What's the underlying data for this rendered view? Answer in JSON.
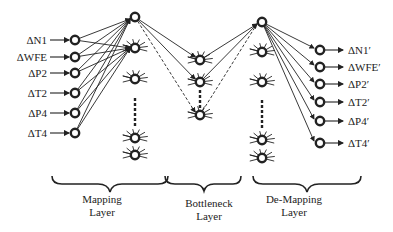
{
  "diagram": {
    "type": "autoassociative-neural-network",
    "inputs": [
      "ΔN1",
      "ΔWFE",
      "ΔP2",
      "ΔT2",
      "ΔP4",
      "ΔT4"
    ],
    "outputs": [
      "ΔN1′",
      "ΔWFE′",
      "ΔP2′",
      "ΔT2′",
      "ΔP4′",
      "ΔT4′"
    ],
    "layers": [
      {
        "name": "mapping",
        "label_line1": "Mapping",
        "label_line2": "Layer"
      },
      {
        "name": "bottleneck",
        "label_line1": "Bottleneck",
        "label_line2": "Layer"
      },
      {
        "name": "demapping",
        "label_line1": "De-Mapping",
        "label_line2": "Layer"
      }
    ],
    "colors": {
      "stroke": "#222222",
      "background": "#ffffff"
    }
  }
}
